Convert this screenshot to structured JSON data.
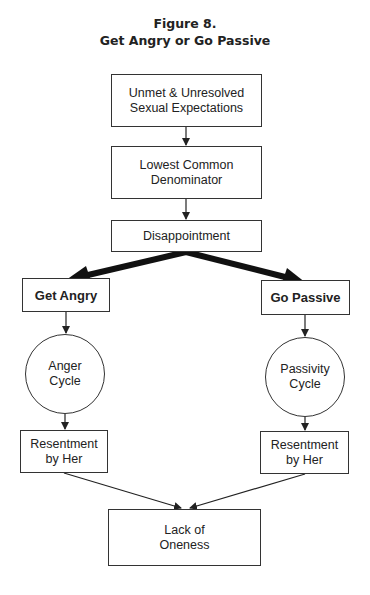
{
  "figure": {
    "number_label": "Figure 8.",
    "title": "Get Angry or Go Passive"
  },
  "nodes": {
    "unmet": {
      "label": "Unmet & Unresolved\nSexual Expectations",
      "shape": "rect"
    },
    "lowest": {
      "label": "Lowest Common\nDenominator",
      "shape": "rect"
    },
    "disappointment": {
      "label": "Disappointment",
      "shape": "rect"
    },
    "get_angry": {
      "label": "Get Angry",
      "shape": "rect",
      "bold": true
    },
    "go_passive": {
      "label": "Go Passive",
      "shape": "rect",
      "bold": true
    },
    "anger_cycle": {
      "label": "Anger\nCycle",
      "shape": "circle"
    },
    "passivity_cycle": {
      "label": "Passivity\nCycle",
      "shape": "circle"
    },
    "resentment_left": {
      "label": "Resentment\nby Her",
      "shape": "rect"
    },
    "resentment_right": {
      "label": "Resentment\nby Her",
      "shape": "rect"
    },
    "lack_of_oneness": {
      "label": "Lack of\nOneness",
      "shape": "rect"
    }
  },
  "edges": [
    {
      "from": "unmet",
      "to": "lowest",
      "style": "thin"
    },
    {
      "from": "lowest",
      "to": "disappointment",
      "style": "thin"
    },
    {
      "from": "disappointment",
      "to": "get_angry",
      "style": "thick"
    },
    {
      "from": "disappointment",
      "to": "go_passive",
      "style": "thick"
    },
    {
      "from": "get_angry",
      "to": "anger_cycle",
      "style": "thin"
    },
    {
      "from": "go_passive",
      "to": "passivity_cycle",
      "style": "thin"
    },
    {
      "from": "anger_cycle",
      "to": "resentment_left",
      "style": "thin"
    },
    {
      "from": "passivity_cycle",
      "to": "resentment_right",
      "style": "thin"
    },
    {
      "from": "resentment_left",
      "to": "lack_of_oneness",
      "style": "thin"
    },
    {
      "from": "resentment_right",
      "to": "lack_of_oneness",
      "style": "thin"
    }
  ],
  "colors": {
    "line": "#222222",
    "background": "#ffffff"
  }
}
